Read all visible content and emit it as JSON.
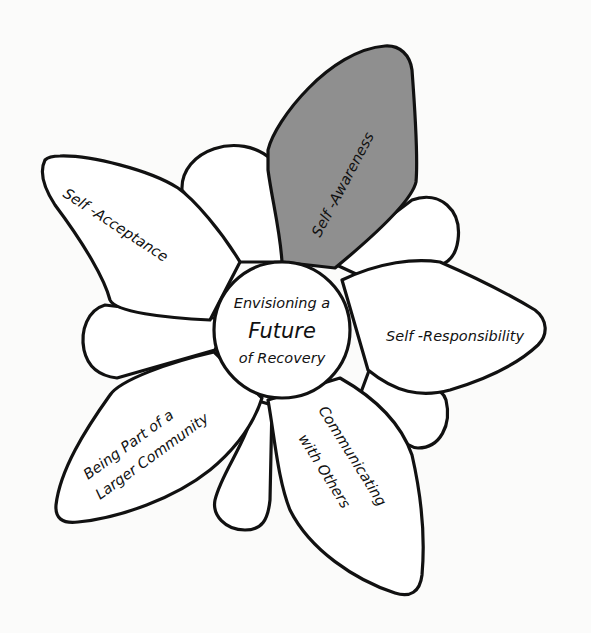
{
  "diagram": {
    "type": "flower",
    "center": {
      "line1": "Envisioning a",
      "line2": "Future",
      "line3": "of Recovery"
    },
    "petals": [
      {
        "label": "Self -Awareness",
        "highlighted": true
      },
      {
        "label": "Self -Responsibility",
        "highlighted": false
      },
      {
        "label": "Communicating",
        "label2": "with Others",
        "highlighted": false
      },
      {
        "label": "Being Part of a",
        "label2": "Larger Community",
        "highlighted": false
      },
      {
        "label": "Self -Acceptance",
        "highlighted": false
      }
    ],
    "colors": {
      "highlight": "#8f8f8f",
      "petal_fill": "#ffffff",
      "outline": "#111111",
      "background": "#fbfbfa"
    }
  }
}
